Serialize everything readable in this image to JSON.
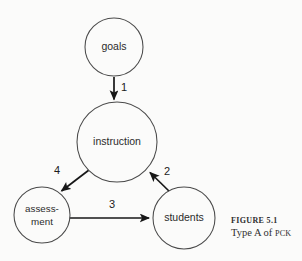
{
  "figure": {
    "caption_label": "FIGURE 5.1",
    "caption_title_prefix": "Type A of ",
    "caption_title_acronym": "PCK",
    "background_color": "#fbfbfa",
    "stroke_color": "#4a4a4a",
    "arrow_color": "#171717",
    "text_color": "#2b2b2b"
  },
  "nodes": [
    {
      "id": "goals",
      "label": "goals",
      "cx": 114,
      "cy": 47,
      "r": 29
    },
    {
      "id": "instruction",
      "label": "instruction",
      "cx": 117,
      "cy": 142,
      "r": 40
    },
    {
      "id": "assessment",
      "label_line1": "assess-",
      "label_line2": "ment",
      "cx": 42,
      "cy": 215,
      "r": 28
    },
    {
      "id": "students",
      "label": "students",
      "cx": 184,
      "cy": 218,
      "r": 31
    }
  ],
  "edges": [
    {
      "id": "edge-1",
      "label": "1",
      "from": "goals",
      "to": "instruction",
      "label_x": 124,
      "label_y": 88
    },
    {
      "id": "edge-2",
      "label": "2",
      "from": "students",
      "to": "instruction",
      "label_x": 167,
      "label_y": 172
    },
    {
      "id": "edge-3",
      "label": "3",
      "from": "assessment",
      "to": "students",
      "label_x": 112,
      "label_y": 205
    },
    {
      "id": "edge-4",
      "label": "4",
      "from": "instruction",
      "to": "assessment",
      "label_x": 57,
      "label_y": 171
    }
  ]
}
